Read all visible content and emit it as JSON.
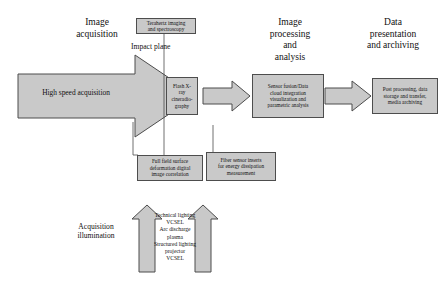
{
  "headers": {
    "image_acquisition": "Image\nacquisition",
    "image_processing": "Image\nprocessing\nand\nanalysis",
    "data_presentation": "Data\npresentation\nand archiving"
  },
  "main_arrow": {
    "label": "High speed acquisition"
  },
  "labels": {
    "impact_plane": "Impact plane",
    "acquisition_illumination": "Acquisition\nillumination"
  },
  "boxes": {
    "terahertz": "Terahertz imaging\nand spectroscopy",
    "flash_xray": "Flash X-\nray\ncineradio-\ngraphy",
    "sensor_fusion": "Sensor fusion/Data\ncloud integration\nvisualization and\nparametric analysis",
    "post_processing": "Post processing, data\nstorage and transfer,\nmedia archiving",
    "full_field": "Full field surface\ndeformation digital\nimage correlation",
    "fiber_sensor": "Fiber sensor inserts\nfor energy dissipation\nmeasurement"
  },
  "illumination": {
    "text": "Technical lighting\nVCSEL\nArc discharge\nplasma\nStructured lighting\nprojector\nVCSEL"
  },
  "colors": {
    "fill": "#c9c9c9",
    "stroke": "#4d4d4d",
    "text": "#111111",
    "background": "#ffffff"
  }
}
